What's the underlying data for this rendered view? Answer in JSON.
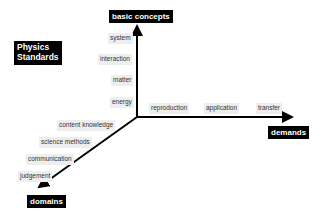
{
  "title_box": {
    "line1": "Physics",
    "line2": "Standards"
  },
  "axes": {
    "vertical": {
      "label": "basic concepts",
      "items": [
        "system",
        "interaction",
        "matter",
        "energy"
      ]
    },
    "horizontal": {
      "label": "demands",
      "items": [
        "reproduction",
        "application",
        "transfer"
      ]
    },
    "diagonal": {
      "label": "domains",
      "items": [
        "content knowledge",
        "science methods",
        "communication",
        "judgement"
      ]
    }
  },
  "colors": {
    "axis": "#000000",
    "label_box": "#000000",
    "item_box": "#eeeeee"
  }
}
